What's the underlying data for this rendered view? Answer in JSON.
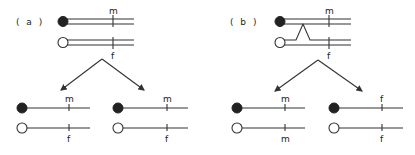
{
  "panels": [
    {
      "label": "( a )",
      "parents": {
        "top_marker": "m",
        "bottom_marker": "f",
        "crossover": false
      },
      "offspring": [
        {
          "top_marker": "m",
          "bottom_marker": "f"
        },
        {
          "top_marker": "m",
          "bottom_marker": "f"
        }
      ]
    },
    {
      "label": "( b )",
      "parents": {
        "top_marker": "m",
        "bottom_marker": "f",
        "crossover": true
      },
      "offspring": [
        {
          "top_marker": "m",
          "bottom_marker": "m"
        },
        {
          "top_marker": "f",
          "bottom_marker": "f"
        }
      ]
    }
  ],
  "colors": {
    "line": "#333333",
    "filled_centromere": "#222222",
    "open_centromere": "#ffffff"
  }
}
